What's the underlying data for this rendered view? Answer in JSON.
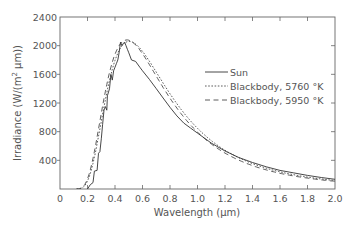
{
  "chart_data": {
    "type": "line",
    "title": "",
    "xlabel": "Wavelength (µm)",
    "ylabel": "Irradiance (W/(m² µm))",
    "xlim": [
      0,
      2.0
    ],
    "ylim": [
      0,
      2400
    ],
    "xticks": [
      0,
      0.2,
      0.4,
      0.6,
      0.8,
      1.0,
      1.2,
      1.4,
      1.6,
      1.8,
      2.0
    ],
    "xtick_labels": [
      "0",
      "0.2",
      "0.4",
      "0.6",
      "0.8",
      "1.0",
      "1.2",
      "1.4",
      "1.6",
      "1.8",
      "2.0"
    ],
    "yticks": [
      400,
      800,
      1200,
      1600,
      2000,
      2400
    ],
    "ytick_labels": [
      "400",
      "800",
      "1200",
      "1600",
      "2000",
      "2400"
    ],
    "grid": false,
    "legend_position": "upper right (inside)",
    "legend": [
      "Sun",
      "Blackbody, 5760 °K",
      "Blackbody, 5950 °K"
    ],
    "series": [
      {
        "name": "Sun",
        "style": "solid",
        "x": [
          0.2,
          0.22,
          0.24,
          0.25,
          0.27,
          0.28,
          0.29,
          0.3,
          0.31,
          0.32,
          0.33,
          0.34,
          0.345,
          0.36,
          0.37,
          0.38,
          0.39,
          0.4,
          0.41,
          0.42,
          0.43,
          0.44,
          0.45,
          0.46,
          0.47,
          0.48,
          0.49,
          0.5,
          0.52,
          0.55,
          0.58,
          0.6,
          0.65,
          0.7,
          0.75,
          0.8,
          0.85,
          0.9,
          0.95,
          1.0,
          1.1,
          1.2,
          1.3,
          1.4,
          1.5,
          1.6,
          1.7,
          1.8,
          1.9,
          2.0
        ],
        "y": [
          0,
          60,
          90,
          250,
          260,
          500,
          520,
          700,
          900,
          1100,
          1150,
          1100,
          1300,
          1400,
          1600,
          1520,
          1650,
          1700,
          1750,
          1800,
          1900,
          2050,
          2000,
          2030,
          2050,
          2000,
          1950,
          1900,
          1800,
          1780,
          1700,
          1650,
          1530,
          1400,
          1270,
          1140,
          1020,
          920,
          850,
          780,
          640,
          530,
          440,
          370,
          310,
          260,
          225,
          190,
          160,
          135
        ]
      },
      {
        "name": "Blackbody, 5760 °K",
        "style": "dotted",
        "temperature_K": 5760,
        "peak_um": 0.503,
        "peak_value": 2060
      },
      {
        "name": "Blackbody, 5950 °K",
        "style": "dashed",
        "temperature_K": 5950,
        "peak_um": 0.487,
        "peak_value": 2080
      }
    ]
  },
  "labels": {
    "xlabel": "Wavelength (µm)",
    "ylabel_prefix": "Irradiance (W/(m",
    "ylabel_sup": "2",
    "ylabel_suffix": " µm))",
    "legend_sun": "Sun",
    "legend_bb1": "Blackbody, 5760 °K",
    "legend_bb2": "Blackbody, 5950 °K"
  },
  "colors": {
    "axis": "#666666",
    "text": "#555555",
    "line": "#333333",
    "background": "#ffffff"
  }
}
